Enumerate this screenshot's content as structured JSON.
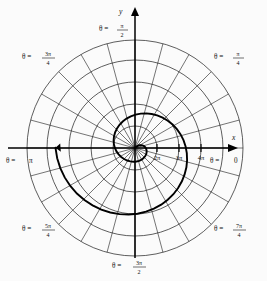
{
  "figure": {
    "axes": {
      "y_label": "y",
      "x_label": "x"
    },
    "angle_labels": [
      {
        "id": "theta-pi-over-2",
        "prefix": "θ =",
        "num": "π",
        "den": "2",
        "whole": null
      },
      {
        "id": "theta-pi-over-4",
        "prefix": "θ =",
        "num": "π",
        "den": "4",
        "whole": null
      },
      {
        "id": "theta-3pi-over-4",
        "prefix": "θ =",
        "num": "3π",
        "den": "4",
        "whole": null
      },
      {
        "id": "theta-5pi-over-4",
        "prefix": "θ =",
        "num": "5π",
        "den": "4",
        "whole": null
      },
      {
        "id": "theta-7pi-over-4",
        "prefix": "θ =",
        "num": "7π",
        "den": "4",
        "whole": null
      },
      {
        "id": "theta-3pi-over-2",
        "prefix": "θ =",
        "num": "3π",
        "den": "2",
        "whole": null
      },
      {
        "id": "theta-pi",
        "prefix": "θ =",
        "num": null,
        "den": null,
        "whole": "π"
      },
      {
        "id": "theta-zero",
        "prefix": "θ =",
        "num": null,
        "den": null,
        "whole": "0"
      }
    ],
    "radial_ticks": [
      "2π",
      "3π",
      "4π"
    ],
    "colors": {
      "ink": "#111111",
      "grid": "#1a1a1a",
      "curve": "#000000",
      "background": "#fbfbfb"
    },
    "geometry": {
      "center_x": 135,
      "center_y": 148,
      "circle_count": 5,
      "spoke_count": 24,
      "spoke_step_degrees": 15
    },
    "curve": {
      "name": "archimedean-spiral",
      "equation": "r = θ",
      "direction": "counterclockwise",
      "arrowhead": "yes"
    }
  }
}
